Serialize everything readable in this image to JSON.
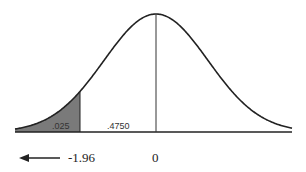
{
  "chart_data": {
    "type": "area",
    "distribution": {
      "mean": 0,
      "sd": 1
    },
    "x_range": [
      -3.6,
      3.6
    ],
    "shaded_region": {
      "from": "-inf",
      "to": -1.96,
      "area": ".025"
    },
    "unshaded_region_label": {
      "from": -1.96,
      "to": 0,
      "area": ".4750"
    },
    "tick_labels": [
      "-1.96",
      "0"
    ],
    "arrow": {
      "direction": "left",
      "position": "below left tail"
    },
    "colors": {
      "shade": "#7a7a7a",
      "curve": "#222222",
      "background": "#ffffff"
    }
  },
  "labels": {
    "tail_area": ".025",
    "center_area": ".4750",
    "critical_value": "-1.96",
    "mean": "0"
  }
}
